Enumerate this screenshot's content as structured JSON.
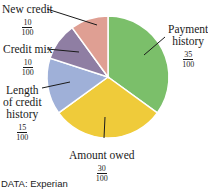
{
  "chart_data": {
    "type": "pie",
    "title": "",
    "slices": [
      {
        "label": "Payment history",
        "value": 35,
        "fraction": "35/100",
        "color": "#7bbf6a"
      },
      {
        "label": "Amount owed",
        "value": 30,
        "fraction": "30/100",
        "color": "#efcb3a"
      },
      {
        "label": "Length of credit history",
        "value": 15,
        "fraction": "15/100",
        "color": "#9fb0d8"
      },
      {
        "label": "Credit mix",
        "value": 10,
        "fraction": "10/100",
        "color": "#8f7ea3"
      },
      {
        "label": "New credit",
        "value": 10,
        "fraction": "10/100",
        "color": "#df9f93"
      }
    ],
    "source": "DATA: Experian"
  },
  "labels": {
    "new_credit": {
      "text": "New credit",
      "num": "10",
      "den": "100"
    },
    "credit_mix": {
      "text": "Credit mix",
      "num": "10",
      "den": "100"
    },
    "length": {
      "line1": "Length",
      "line2": "of credit",
      "line3": "history",
      "num": "15",
      "den": "100"
    },
    "amount_owed": {
      "text": "Amount owed",
      "num": "30",
      "den": "100"
    },
    "payment": {
      "line1": "Payment",
      "line2": "history",
      "num": "35",
      "den": "100"
    }
  },
  "source": "DATA: Experian"
}
